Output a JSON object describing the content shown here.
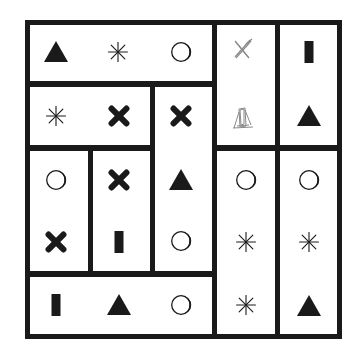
{
  "puzzle": {
    "ink_color": "#1a1a1a",
    "pencil_color": "#8a8a8a",
    "regions": [
      {
        "id": "top-band",
        "x": 25,
        "y": 20,
        "w": 192,
        "h": 66
      },
      {
        "id": "mid-left-band",
        "x": 25,
        "y": 82,
        "w": 130,
        "h": 68
      },
      {
        "id": "col3-tall",
        "x": 150,
        "y": 82,
        "w": 67,
        "h": 194
      },
      {
        "id": "col1-lower",
        "x": 25,
        "y": 146,
        "w": 68,
        "h": 130
      },
      {
        "id": "col2-lower",
        "x": 88,
        "y": 146,
        "w": 67,
        "h": 130
      },
      {
        "id": "bottom-band",
        "x": 25,
        "y": 272,
        "w": 192,
        "h": 67
      },
      {
        "id": "col4-upper",
        "x": 212,
        "y": 20,
        "w": 68,
        "h": 130
      },
      {
        "id": "col5-upper",
        "x": 275,
        "y": 20,
        "w": 67,
        "h": 130
      },
      {
        "id": "col4-lower",
        "x": 212,
        "y": 146,
        "w": 68,
        "h": 193
      },
      {
        "id": "col5-lower",
        "x": 275,
        "y": 146,
        "w": 67,
        "h": 193
      }
    ],
    "symbols": [
      {
        "region": "top-band",
        "shape": "triangle",
        "x": 56,
        "y": 52
      },
      {
        "region": "top-band",
        "shape": "asterisk",
        "x": 118,
        "y": 52
      },
      {
        "region": "top-band",
        "shape": "circle",
        "x": 181,
        "y": 52
      },
      {
        "region": "mid-left-band",
        "shape": "asterisk",
        "x": 56,
        "y": 116
      },
      {
        "region": "mid-left-band",
        "shape": "cross",
        "x": 119,
        "y": 116
      },
      {
        "region": "col3-tall",
        "shape": "cross",
        "x": 181,
        "y": 116
      },
      {
        "region": "col3-tall",
        "shape": "triangle",
        "x": 181,
        "y": 180
      },
      {
        "region": "col3-tall",
        "shape": "circle",
        "x": 181,
        "y": 241
      },
      {
        "region": "col1-lower",
        "shape": "circle",
        "x": 56,
        "y": 180
      },
      {
        "region": "col1-lower",
        "shape": "cross",
        "x": 56,
        "y": 242
      },
      {
        "region": "col2-lower",
        "shape": "cross",
        "x": 119,
        "y": 180
      },
      {
        "region": "col2-lower",
        "shape": "bar",
        "x": 119,
        "y": 242
      },
      {
        "region": "bottom-band",
        "shape": "bar",
        "x": 56,
        "y": 305
      },
      {
        "region": "bottom-band",
        "shape": "triangle",
        "x": 119,
        "y": 305
      },
      {
        "region": "bottom-band",
        "shape": "circle",
        "x": 181,
        "y": 305
      },
      {
        "region": "col4-upper",
        "shape": "pencil-cross",
        "x": 242,
        "y": 49
      },
      {
        "region": "col4-upper",
        "shape": "pencil-sketch",
        "x": 243,
        "y": 118
      },
      {
        "region": "col5-upper",
        "shape": "bar",
        "x": 309,
        "y": 52
      },
      {
        "region": "col5-upper",
        "shape": "triangle",
        "x": 309,
        "y": 116
      },
      {
        "region": "col4-lower",
        "shape": "circle",
        "x": 246,
        "y": 180
      },
      {
        "region": "col4-lower",
        "shape": "asterisk",
        "x": 246,
        "y": 242
      },
      {
        "region": "col4-lower",
        "shape": "asterisk",
        "x": 246,
        "y": 305
      },
      {
        "region": "col5-lower",
        "shape": "circle",
        "x": 309,
        "y": 180
      },
      {
        "region": "col5-lower",
        "shape": "asterisk",
        "x": 309,
        "y": 242
      },
      {
        "region": "col5-lower",
        "shape": "triangle",
        "x": 309,
        "y": 306
      }
    ]
  }
}
